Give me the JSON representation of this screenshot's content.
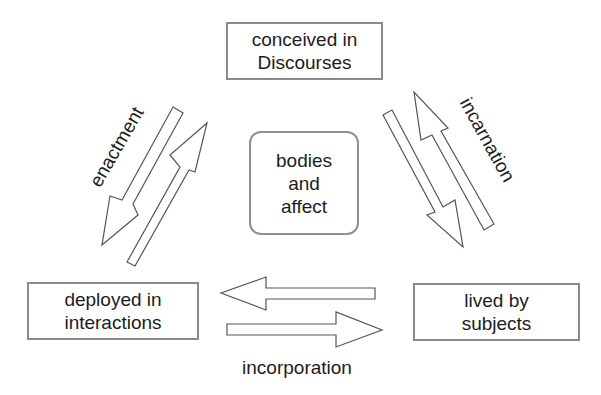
{
  "diagram": {
    "nodes": [
      {
        "id": "discourses",
        "lines": [
          "conceived in",
          "Discourses"
        ]
      },
      {
        "id": "center",
        "lines": [
          "bodies",
          "and",
          "affect"
        ]
      },
      {
        "id": "interactions",
        "lines": [
          "deployed in",
          "interactions"
        ]
      },
      {
        "id": "subjects",
        "lines": [
          "lived by",
          "subjects"
        ]
      }
    ],
    "edges": [
      {
        "label": "enactment",
        "from": "discourses",
        "to": "interactions",
        "bidirectional": true
      },
      {
        "label": "incarnation",
        "from": "discourses",
        "to": "subjects",
        "bidirectional": true
      },
      {
        "label": "incorporation",
        "from": "interactions",
        "to": "subjects",
        "bidirectional": true
      }
    ],
    "colors": {
      "text": "#1c1c1c",
      "box_border": "#8a8a8a",
      "arrow_stroke": "#555555",
      "background": "#ffffff"
    }
  }
}
